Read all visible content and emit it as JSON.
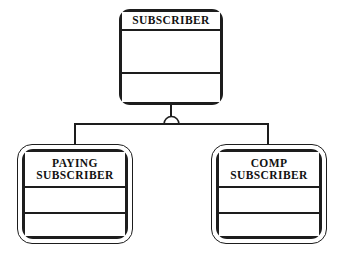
{
  "diagram": {
    "type": "erd-subtype-supertype",
    "notation": "IDEF1X category / generalization",
    "background_color": "#ffffff",
    "line_color": "#1d1d1d",
    "text_color": "#111111"
  },
  "supertype": {
    "name": "subscriber-entity",
    "title": "SUBSCRIBER",
    "compartments": 3
  },
  "subtypes": [
    {
      "name": "paying-subscriber-entity",
      "title_lines": [
        "PAYING",
        "SUBSCRIBER"
      ],
      "title": "PAYING SUBSCRIBER",
      "compartments": 3
    },
    {
      "name": "comp-subscriber-entity",
      "title_lines": [
        "COMP",
        "SUBSCRIBER"
      ],
      "title": "COMP SUBSCRIBER",
      "compartments": 3
    }
  ],
  "connector": {
    "symbol": "generalization-semicircle",
    "description": "semicircle arc joining supertype to subtype branch line"
  }
}
